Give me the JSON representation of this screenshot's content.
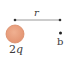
{
  "diagram": {
    "charge": {
      "label": "2q",
      "fill_color": "#e9a07c",
      "stroke_color": "#d9825c"
    },
    "distance": {
      "label": "r"
    },
    "point": {
      "label": "b"
    },
    "line_color": "#8a8a8a",
    "dot_color": "#222222"
  }
}
